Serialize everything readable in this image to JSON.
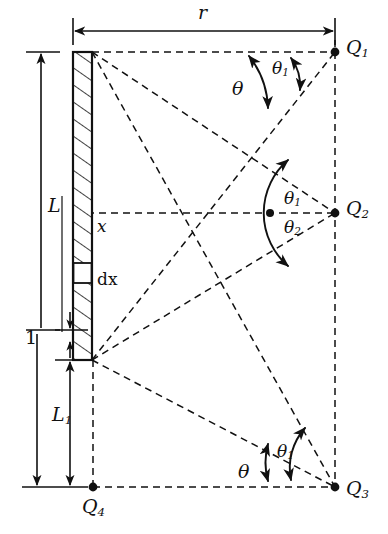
{
  "figure": {
    "type": "physics-geometry-schematic",
    "canvas": {
      "width": 388,
      "height": 534
    },
    "stroke_color": "#111111",
    "fill_color": "#ffffff",
    "background": "#ffffff"
  },
  "labels": {
    "r": "r",
    "L": "L",
    "x": "x",
    "dx": "dx",
    "one": "1",
    "L1_base": "L",
    "L1_sub": "1",
    "theta": "θ",
    "theta1_sub": "1",
    "theta2_sub": "2",
    "Q": "Q",
    "Q1_sub": "1",
    "Q2_sub": "2",
    "Q3_sub": "3",
    "Q4_sub": "4"
  },
  "points": {
    "Q1": {
      "label": "Q1",
      "x": 335,
      "y": 52
    },
    "Q2": {
      "label": "Q2",
      "x": 335,
      "y": 213
    },
    "Q3": {
      "label": "Q3",
      "x": 335,
      "y": 487
    },
    "Q4": {
      "label": "Q4",
      "x": 93,
      "y": 487
    },
    "rod_top": {
      "x": 92,
      "y": 52
    },
    "rod_bottom": {
      "x": 92,
      "y": 360
    },
    "mid_marker": {
      "x": 270,
      "y": 213
    }
  },
  "rod": {
    "name": "charged-rod",
    "left": 73,
    "right": 92,
    "top": 52,
    "bottom": 360,
    "hatched": true,
    "dx_band": {
      "top": 263,
      "bottom": 283
    }
  },
  "dimensions": [
    {
      "name": "r",
      "text": "r",
      "orientation": "horizontal",
      "from_x": 73,
      "to_x": 335,
      "y": 30
    },
    {
      "name": "L",
      "text": "L",
      "orientation": "vertical",
      "from_y": 52,
      "to_y": 330,
      "x": 41
    },
    {
      "name": "one",
      "text": "1",
      "orientation": "vertical",
      "from_y": 330,
      "to_y": 360,
      "x": 70
    },
    {
      "name": "L1",
      "text": "L1",
      "orientation": "vertical",
      "from_y": 360,
      "to_y": 487,
      "x": 70
    }
  ],
  "angles": [
    {
      "name": "theta-at-Q1",
      "text": "θ",
      "vertex": "Q1"
    },
    {
      "name": "theta1-at-Q1",
      "text": "θ1",
      "vertex": "Q1"
    },
    {
      "name": "theta1-at-Q2",
      "text": "θ1",
      "vertex": "Q2"
    },
    {
      "name": "theta2-at-Q2",
      "text": "θ2",
      "vertex": "Q2"
    },
    {
      "name": "theta-at-Q3",
      "text": "θ",
      "vertex": "Q3"
    },
    {
      "name": "theta1-at-Q3",
      "text": "θ1",
      "vertex": "Q3"
    }
  ]
}
